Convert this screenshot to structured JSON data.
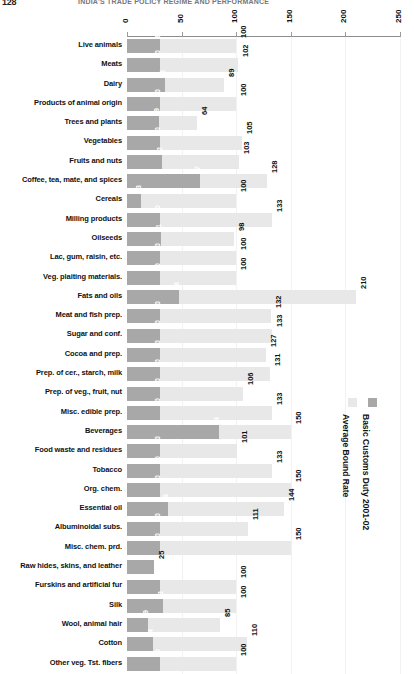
{
  "header": {
    "page_number": "128",
    "title": "INDIA'S TRADE POLICY REGIME AND PERFORMANCE"
  },
  "legend": {
    "items": [
      {
        "label": "Average Bound Rate",
        "color": "#e8e8e8",
        "name": "average-bound-rate"
      },
      {
        "label": "Basic Customs Duty 2001-02",
        "color": "#a8a8a8",
        "name": "basic-customs-duty"
      }
    ]
  },
  "chart_data": {
    "type": "bar",
    "orientation": "horizontal",
    "title": "",
    "xlabel": "",
    "ylabel": "",
    "xlim": [
      0,
      250
    ],
    "ticks": [
      0,
      50,
      100,
      150,
      200,
      250
    ],
    "grid": true,
    "legend_position": "right",
    "categories": [
      "Live animals",
      "Meats",
      "Dairy",
      "Products of animal origin",
      "Trees and plants",
      "Vegetables",
      "Fruits and nuts",
      "Coffee, tea, mate, and spices",
      "Cereals",
      "Milling products",
      "Oilseeds",
      "Lac, gum, raisin, etc.",
      "Veg. plaiting materials.",
      "Fats and oils",
      "Meat and fish prep.",
      "Sugar and conf.",
      "Cocoa and prep.",
      "Prep. of cer., starch, milk",
      "Prep. of veg., fruit, nut",
      "Misc. edible prep.",
      "Beverages",
      "Food waste and residues",
      "Tobacco",
      "Org. chem.",
      "Essential oil",
      "Albuminoidal subs.",
      "Misc. chem. prd.",
      "Raw hides, skins, and leather",
      "Furskins and artificial fur",
      "Silk",
      "Wool, animal hair",
      "Cotton",
      "Other veg. Tst. fibers"
    ],
    "series": [
      {
        "name": "Average Bound Rate",
        "color": "#e8e8e8",
        "values": [
          100,
          102,
          89,
          100,
          64,
          105,
          103,
          128,
          100,
          133,
          98,
          100,
          100,
          210,
          132,
          133,
          127,
          131,
          106,
          133,
          150,
          101,
          133,
          150,
          144,
          111,
          150,
          0,
          100,
          100,
          85,
          110,
          100
        ]
      },
      {
        "name": "Basic Customs Duty 2001-02",
        "color": "#a8a8a8",
        "values": [
          30,
          30,
          35,
          30,
          29,
          30,
          32,
          67,
          13,
          30,
          31,
          30,
          30,
          48,
          30,
          30,
          30,
          30,
          30,
          30,
          84,
          30,
          30,
          30,
          38,
          30,
          30,
          25,
          30,
          33,
          19,
          24,
          30
        ]
      }
    ]
  }
}
